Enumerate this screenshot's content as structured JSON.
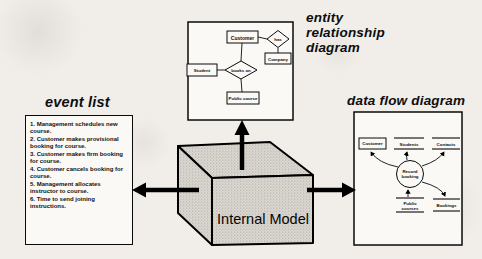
{
  "titles": {
    "event_list": "event list",
    "erd": [
      "entity",
      "relationship",
      "diagram"
    ],
    "dfd": "data flow diagram"
  },
  "event_list": {
    "items": [
      "1. Management schedules new course.",
      "2. Customer makes provisional booking for course.",
      "3. Customer makes firm booking for course.",
      "4. Customer cancels booking for course.",
      "5. Management allocates instructor to course.",
      "6. Time to send joining instructions."
    ]
  },
  "erd": {
    "customer": "Customer",
    "student": "Student",
    "company": "Company",
    "public_course": "Public course",
    "rel_center": "books on",
    "rel_right": "has"
  },
  "dfd": {
    "external_customer": "Customer",
    "store_students": "Students",
    "store_contacts": "Contacts",
    "store_public_line1": "Public",
    "store_public_line2": "courses",
    "store_bookings": "Bookings",
    "process_line1": "Record",
    "process_line2": "booking"
  },
  "cube": {
    "label": "Internal Model"
  }
}
